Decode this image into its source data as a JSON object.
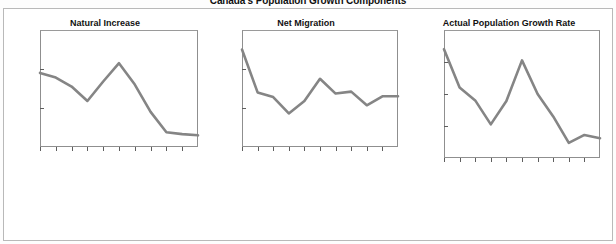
{
  "figure": {
    "title": "Canada's Population Growth Components",
    "background": "#ffffff",
    "line_color": "#858585",
    "axis_color": "#8f8f8f"
  },
  "chart_data": [
    {
      "type": "line",
      "title": "Natural Increase",
      "xlabel": "Years",
      "ylabel": "Percent",
      "ylim": [
        0,
        3.0
      ],
      "yticks": [
        "0",
        "1.0",
        "2.0",
        "3.0"
      ],
      "ytick_values": [
        0,
        1.0,
        2.0,
        3.0
      ],
      "grid": false,
      "legend": "none",
      "categories": [
        "1901–11",
        "1911–21",
        "1921–31",
        "1931–41",
        "1941–51",
        "1951–61",
        "1961–71",
        "1971–81",
        "1981–91",
        "1991–01"
      ],
      "x": [
        0,
        1,
        2,
        3,
        4,
        5,
        6,
        7,
        8,
        9,
        10
      ],
      "values": [
        1.9,
        1.78,
        1.55,
        1.18,
        1.68,
        2.15,
        1.6,
        0.9,
        0.38,
        0.33,
        0.3
      ]
    },
    {
      "type": "line",
      "title": "Net Migration",
      "xlabel": "Years",
      "ylabel": "Percent",
      "ylim": [
        -1.0,
        2.0
      ],
      "yticks": [
        "-1.0",
        "0",
        "1.0",
        "2.0"
      ],
      "ytick_values": [
        -1.0,
        0,
        1.0,
        2.0
      ],
      "grid": false,
      "legend": "none",
      "categories": [
        "1901–11",
        "1911–21",
        "1921–31",
        "1931–41",
        "1941–51",
        "1951–61",
        "1961–71",
        "1971–81",
        "1981–91",
        "1991–01"
      ],
      "x": [
        0,
        1,
        2,
        3,
        4,
        5,
        6,
        7,
        8,
        9,
        10
      ],
      "values": [
        1.5,
        0.4,
        0.28,
        -0.14,
        0.18,
        0.75,
        0.37,
        0.42,
        0.07,
        0.3,
        0.3
      ]
    },
    {
      "type": "line",
      "title": "Actual Population Growth Rate",
      "xlabel": "Years",
      "ylabel": "Percent",
      "ylim": [
        0,
        4.0
      ],
      "yticks": [
        "0",
        "1.0",
        "2.0",
        "3.0",
        "4.0"
      ],
      "ytick_values": [
        0,
        1.0,
        2.0,
        3.0,
        4.0
      ],
      "grid": false,
      "legend": "none",
      "categories": [
        "1901–11",
        "1911–21",
        "1921–31",
        "1931–41",
        "1941–51",
        "1951–61",
        "1961–71",
        "1971–81",
        "1981–91",
        "1991–01"
      ],
      "x": [
        0,
        1,
        2,
        3,
        4,
        5,
        6,
        7,
        8,
        9,
        10
      ],
      "values": [
        3.4,
        2.2,
        1.8,
        1.05,
        1.78,
        3.05,
        2.0,
        1.3,
        0.47,
        0.72,
        0.62
      ]
    }
  ]
}
